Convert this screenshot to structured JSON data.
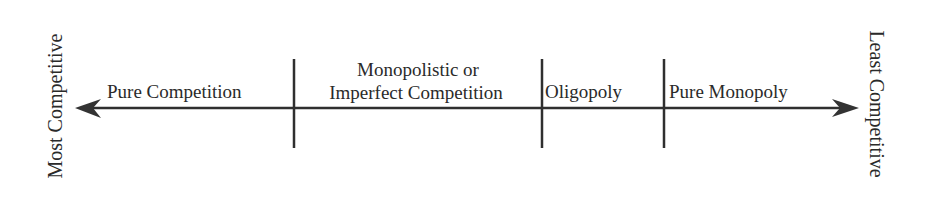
{
  "diagram": {
    "left_end_label": "Most Competitive",
    "right_end_label": "Least Competitive",
    "segments": [
      {
        "label": "Pure Competition"
      },
      {
        "label_line1": "Monopolistic or",
        "label_line2": "Imperfect Competition"
      },
      {
        "label": "Oligopoly"
      },
      {
        "label": "Pure Monopoly"
      }
    ],
    "colors": {
      "line": "#2f2f2f",
      "text": "#2a2a2a",
      "background": "#ffffff"
    }
  }
}
